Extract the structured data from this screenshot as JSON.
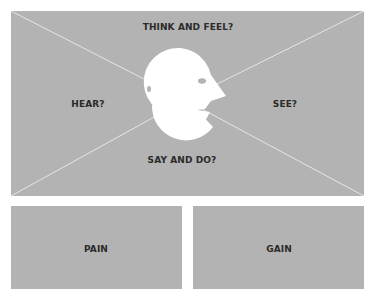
{
  "diagram": {
    "quadrants": {
      "top": "THINK AND FEEL?",
      "left": "HEAR?",
      "right": "SEE?",
      "bottom": "SAY AND DO?"
    },
    "bottom_panels": {
      "pain": "PAIN",
      "gain": "GAIN"
    },
    "center_icon": "head-profile-icon",
    "colors": {
      "panel": "#b3b3b3",
      "lines": "#e6e6e6",
      "text": "#2b2b2b",
      "head": "#ffffff"
    }
  }
}
